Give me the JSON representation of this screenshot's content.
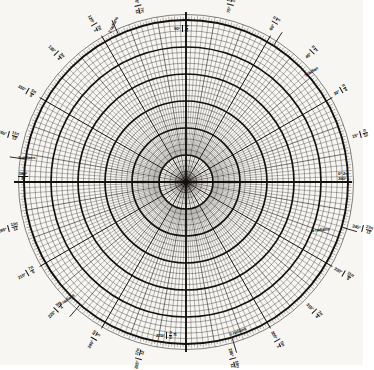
{
  "figure": {
    "kind": "polar-graph-paper",
    "background_color": "#f7f6f3",
    "ink_color": "#14110e"
  },
  "chart_data": {
    "type": "polar-grid",
    "title": "",
    "subtitle": "",
    "xlabel": "",
    "ylabel": "",
    "center": {
      "x": 186,
      "y": 182
    },
    "outer_radius": 162,
    "grid": true,
    "legend_position": "none",
    "angular": {
      "unit_primary": "degrees",
      "unit_secondary": "radians",
      "minor_step_deg": 2,
      "medium_step_deg": 10,
      "major_step_deg": 30,
      "labeled_step_deg": 15,
      "radian_marks": [
        1,
        2,
        3,
        4,
        5,
        6
      ]
    },
    "radial": {
      "major_circles": 6,
      "minor_circles_per_major": 4,
      "major_radii_px": [
        27,
        54,
        81,
        108,
        135,
        162
      ],
      "values": [
        1,
        2,
        3,
        4,
        5,
        6
      ],
      "rlim": [
        0,
        6
      ]
    },
    "axis_labels": [
      {
        "angle_deg": 0,
        "degrees": "0°",
        "radians_top": "2π",
        "degrees_alt": "360°"
      },
      {
        "angle_deg": 90,
        "degrees": "90°",
        "radians": "π/2"
      },
      {
        "angle_deg": 180,
        "degrees": "180°",
        "radians": "π"
      },
      {
        "angle_deg": 270,
        "degrees": "270°",
        "radians": "3/2 π"
      }
    ],
    "tick_labels_deg": [
      {
        "angle": 15,
        "degrees": "15°",
        "num": "π",
        "den": "12"
      },
      {
        "angle": 30,
        "degrees": "30°",
        "num": "π",
        "den": "6"
      },
      {
        "angle": 45,
        "degrees": "45°",
        "num": "π",
        "den": "4"
      },
      {
        "angle": 60,
        "degrees": "60°",
        "num": "π",
        "den": "3"
      },
      {
        "angle": 75,
        "degrees": "75°",
        "num": "5π",
        "den": "12"
      },
      {
        "angle": 105,
        "degrees": "105°",
        "num": "7π",
        "den": "12"
      },
      {
        "angle": 120,
        "degrees": "120°",
        "num": "2π",
        "den": "3"
      },
      {
        "angle": 135,
        "degrees": "135°",
        "num": "3π",
        "den": "4"
      },
      {
        "angle": 150,
        "degrees": "150°",
        "num": "5π",
        "den": "6"
      },
      {
        "angle": 165,
        "degrees": "165°",
        "num": "11π",
        "den": "12"
      },
      {
        "angle": 195,
        "degrees": "195°",
        "num": "13π",
        "den": "12"
      },
      {
        "angle": 210,
        "degrees": "210°",
        "num": "7π",
        "den": "6"
      },
      {
        "angle": 225,
        "degrees": "225°",
        "num": "5π",
        "den": "4"
      },
      {
        "angle": 240,
        "degrees": "240°",
        "num": "4π",
        "den": "3"
      },
      {
        "angle": 255,
        "degrees": "255°",
        "num": "17π",
        "den": "12"
      },
      {
        "angle": 285,
        "degrees": "285°",
        "num": "19π",
        "den": "12"
      },
      {
        "angle": 300,
        "degrees": "300°",
        "num": "5π",
        "den": "3"
      },
      {
        "angle": 315,
        "degrees": "315°",
        "num": "7π",
        "den": "4"
      },
      {
        "angle": 330,
        "degrees": "330°",
        "num": "11π",
        "den": "6"
      },
      {
        "angle": 345,
        "degrees": "345°",
        "num": "23π",
        "den": "12"
      }
    ],
    "radian_callouts": [
      {
        "label": "1 radian",
        "angle_deg": 57.3
      },
      {
        "label": "2 radians",
        "angle_deg": 114.6
      },
      {
        "label": "3 radians",
        "angle_deg": 171.9
      },
      {
        "label": "4 radians",
        "angle_deg": 229.2
      },
      {
        "label": "5 radians",
        "angle_deg": 286.5
      },
      {
        "label": "6 radians",
        "angle_deg": 343.8
      }
    ]
  },
  "labels": {
    "right_top": "0°  2π",
    "right_bottom": "360°",
    "top_deg": "90°",
    "top_num": "π",
    "top_den": "2",
    "left_deg": "180°",
    "left_pi": "π",
    "bottom_deg": "270°",
    "bottom_num": "3",
    "bottom_den": "2",
    "bottom_pi": "π",
    "rad1": "1 radian",
    "rad2": "2 radians",
    "rad3": "3 radians",
    "rad4": "4 radians",
    "rad5": "5 radians",
    "rad6": "6 radians",
    "d15": "15°",
    "n15": "π",
    "q15": "12",
    "d30": "30°",
    "n30": "π",
    "q30": "6",
    "d45": "45°",
    "n45": "π",
    "q45": "4",
    "d60": "60°",
    "n60": "π",
    "q60": "3",
    "d75": "75°",
    "n75": "5π",
    "q75": "12",
    "d105": "105°",
    "n105": "7π",
    "q105": "12",
    "d120": "120°",
    "n120": "2π",
    "q120": "3",
    "d135": "135°",
    "n135": "3π",
    "q135": "4",
    "d150": "150°",
    "n150": "5π",
    "q150": "6",
    "d165": "165°",
    "n165": "11π",
    "q165": "12",
    "d195": "195°",
    "n195": "13π",
    "q195": "12",
    "d210": "210°",
    "n210": "7π",
    "q210": "6",
    "d225": "225°",
    "n225": "5π",
    "q225": "4",
    "d240": "240°",
    "n240": "4π",
    "q240": "3",
    "d255": "255°",
    "n255": "17π",
    "q255": "12",
    "d285": "285°",
    "n285": "19π",
    "q285": "12",
    "d300": "300°",
    "n300": "5π",
    "q300": "3",
    "d315": "315°",
    "n315": "7π",
    "q315": "4",
    "d330": "330°",
    "n330": "11π",
    "q330": "6",
    "d345": "345°",
    "n345": "23π",
    "q345": "12"
  }
}
